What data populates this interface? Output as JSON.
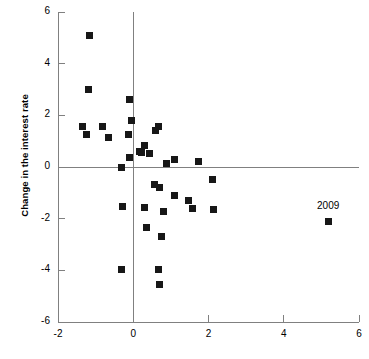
{
  "chart_data": {
    "type": "scatter",
    "title": "",
    "subtitle": "",
    "xlabel": "",
    "ylabel": "Change in the interest rate",
    "xlim": [
      -2,
      6
    ],
    "ylim": [
      -6,
      6
    ],
    "xticks": [
      -2,
      0,
      2,
      4,
      6
    ],
    "xticklabels": [
      "-2",
      "0",
      "2",
      "4",
      "6"
    ],
    "yticks": [
      -6,
      -4,
      -2,
      0,
      2,
      4,
      6
    ],
    "yticklabels": [
      "-6",
      "-4",
      "-2",
      "0",
      "2",
      "4",
      "6"
    ],
    "grid": false,
    "legend": null,
    "marker": "square",
    "marker_color": "#171717",
    "axis_color": "#808080",
    "zero_lines": {
      "x": 0,
      "y": 0
    },
    "series": [
      {
        "name": "observations",
        "points": [
          {
            "x": -1.15,
            "y": 5.1
          },
          {
            "x": -1.18,
            "y": 3.0
          },
          {
            "x": -0.1,
            "y": 2.6
          },
          {
            "x": -0.05,
            "y": 1.8
          },
          {
            "x": -1.36,
            "y": 1.55
          },
          {
            "x": -0.82,
            "y": 1.57
          },
          {
            "x": -1.25,
            "y": 1.27
          },
          {
            "x": -0.66,
            "y": 1.15
          },
          {
            "x": -0.13,
            "y": 1.24
          },
          {
            "x": 0.67,
            "y": 1.58
          },
          {
            "x": 0.6,
            "y": 1.4
          },
          {
            "x": 0.3,
            "y": 0.82
          },
          {
            "x": 0.16,
            "y": 0.6
          },
          {
            "x": 0.22,
            "y": 0.55
          },
          {
            "x": 0.42,
            "y": 0.52
          },
          {
            "x": -0.09,
            "y": 0.36
          },
          {
            "x": 1.09,
            "y": 0.3
          },
          {
            "x": 0.88,
            "y": 0.12
          },
          {
            "x": 1.74,
            "y": 0.2
          },
          {
            "x": -0.3,
            "y": -0.03
          },
          {
            "x": 2.1,
            "y": -0.48
          },
          {
            "x": 0.57,
            "y": -0.66
          },
          {
            "x": 0.69,
            "y": -0.8
          },
          {
            "x": 1.09,
            "y": -1.12
          },
          {
            "x": 1.46,
            "y": -1.28
          },
          {
            "x": -0.28,
            "y": -1.52
          },
          {
            "x": 0.29,
            "y": -1.57
          },
          {
            "x": 0.81,
            "y": -1.73
          },
          {
            "x": 1.57,
            "y": -1.62
          },
          {
            "x": 2.13,
            "y": -1.63
          },
          {
            "x": 0.36,
            "y": -2.33
          },
          {
            "x": 0.76,
            "y": -2.68
          },
          {
            "x": -0.3,
            "y": -3.96
          },
          {
            "x": 0.68,
            "y": -3.98
          },
          {
            "x": 0.7,
            "y": -4.53
          },
          {
            "x": 5.18,
            "y": -2.1,
            "label": "2009"
          }
        ]
      }
    ],
    "annotations": [
      {
        "text": "2009",
        "x": 5.18,
        "y": -1.55
      }
    ]
  },
  "geometry": {
    "plot_left_px": 58,
    "plot_right_px": 359,
    "plot_top_px": 12,
    "plot_bottom_px": 322,
    "tick_len_px": 7
  }
}
